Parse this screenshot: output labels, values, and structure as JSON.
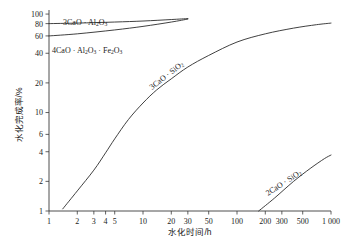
{
  "chart_data": {
    "type": "line",
    "title": "",
    "xlabel": "水化时间/h",
    "ylabel": "水化完成率/%",
    "xscale": "log",
    "yscale": "log",
    "xlim": [
      1,
      1000
    ],
    "ylim": [
      1,
      110
    ],
    "grid": false,
    "legend": "inline-curve-labels",
    "xtick_labels": [
      "1",
      "2",
      "3",
      "4",
      "5",
      "10",
      "20",
      "30",
      "50",
      "100",
      "200",
      "300",
      "500",
      "1 000"
    ],
    "xtick_values": [
      1,
      2,
      3,
      4,
      5,
      10,
      20,
      30,
      50,
      100,
      200,
      300,
      500,
      1000
    ],
    "ytick_labels": [
      "1",
      "2",
      "4",
      "6",
      "10",
      "20",
      "40",
      "60",
      "80",
      "100"
    ],
    "ytick_values": [
      1,
      2,
      4,
      6,
      10,
      20,
      40,
      60,
      80,
      100
    ],
    "series": [
      {
        "name": "3CaO · Al2O3",
        "label": "3CaO · Al₂O₃",
        "label_parts": [
          {
            "t": "3CaO · Al",
            "sub": false
          },
          {
            "t": "2",
            "sub": true
          },
          {
            "t": "O",
            "sub": false
          },
          {
            "t": "3",
            "sub": true
          }
        ],
        "x": [
          1,
          2,
          5,
          10,
          20,
          30
        ],
        "y": [
          80,
          81,
          83,
          85,
          88,
          90
        ]
      },
      {
        "name": "4CaO · Al2O3 · Fe2O3",
        "label": "4CaO · Al₂O₃ · Fe₂O₃",
        "label_parts": [
          {
            "t": "4CaO · Al",
            "sub": false
          },
          {
            "t": "2",
            "sub": true
          },
          {
            "t": "O",
            "sub": false
          },
          {
            "t": "3",
            "sub": true
          },
          {
            "t": " · Fe",
            "sub": false
          },
          {
            "t": "2",
            "sub": true
          },
          {
            "t": "O",
            "sub": false
          },
          {
            "t": "3",
            "sub": true
          }
        ],
        "x": [
          1,
          2,
          5,
          10,
          20,
          30
        ],
        "y": [
          60,
          63,
          69,
          75,
          83,
          89
        ]
      },
      {
        "name": "3CaO · SiO2",
        "label": "3CaO · SiO₂",
        "label_parts": [
          {
            "t": "3CaO · SiO",
            "sub": false
          },
          {
            "t": "2",
            "sub": true
          }
        ],
        "x": [
          1.4,
          2,
          3,
          4,
          5,
          7,
          10,
          14,
          20,
          30,
          50,
          100,
          200,
          400,
          700,
          1000
        ],
        "y": [
          1.05,
          1.6,
          2.6,
          3.9,
          5.4,
          8.5,
          12.5,
          17,
          22,
          29,
          38,
          52,
          63,
          72,
          78,
          81
        ]
      },
      {
        "name": "2CaO · SiO2",
        "label": "2CaO · SiO₂",
        "label_parts": [
          {
            "t": "2CaO · SiO",
            "sub": false
          },
          {
            "t": "2",
            "sub": true
          }
        ],
        "x": [
          170,
          250,
          400,
          600,
          850,
          1000
        ],
        "y": [
          1.0,
          1.35,
          2.0,
          2.7,
          3.4,
          3.7
        ]
      }
    ]
  }
}
